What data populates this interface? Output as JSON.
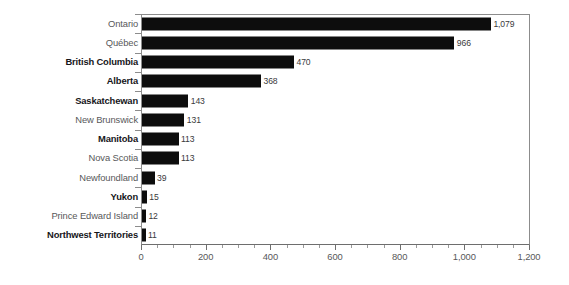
{
  "chart_data": {
    "type": "bar",
    "orientation": "horizontal",
    "title": "",
    "subtitle": "",
    "xlabel": "",
    "ylabel": "",
    "xlim": [
      0,
      1200
    ],
    "grid": false,
    "legend": null,
    "x_ticks": [
      "0",
      "200",
      "400",
      "600",
      "800",
      "1,000",
      "1,200"
    ],
    "x_tick_values": [
      0,
      200,
      400,
      600,
      800,
      1000,
      1200
    ],
    "x_minor_tick_interval": 50,
    "bar_color": "#0d0d0d",
    "frame_color": "#8c8c8c",
    "label_color": "#58585a",
    "label_color_bold": "#16161a",
    "categories": [
      "Ontario",
      "Québec",
      "British Columbia",
      "Alberta",
      "Saskatchewan",
      "New Brunswick",
      "Manitoba",
      "Nova Scotia",
      "Newfoundland",
      "Yukon",
      "Prince Edward Island",
      "Northwest Territories"
    ],
    "values": [
      1079,
      966,
      470,
      368,
      143,
      131,
      113,
      113,
      39,
      15,
      12,
      11
    ],
    "value_labels": [
      "1,079",
      "966",
      "470",
      "368",
      "143",
      "131",
      "113",
      "113",
      "39",
      "15",
      "12",
      "11"
    ],
    "emphasis": [
      false,
      false,
      true,
      true,
      true,
      false,
      true,
      false,
      false,
      true,
      false,
      true
    ],
    "bars": [
      {
        "category": "Ontario",
        "value": 1079,
        "label": "1,079",
        "bold": false
      },
      {
        "category": "Québec",
        "value": 966,
        "label": "966",
        "bold": false
      },
      {
        "category": "British Columbia",
        "value": 470,
        "label": "470",
        "bold": true
      },
      {
        "category": "Alberta",
        "value": 368,
        "label": "368",
        "bold": true
      },
      {
        "category": "Saskatchewan",
        "value": 143,
        "label": "143",
        "bold": true
      },
      {
        "category": "New Brunswick",
        "value": 131,
        "label": "131",
        "bold": false
      },
      {
        "category": "Manitoba",
        "value": 113,
        "label": "113",
        "bold": true
      },
      {
        "category": "Nova Scotia",
        "value": 113,
        "label": "113",
        "bold": false
      },
      {
        "category": "Newfoundland",
        "value": 39,
        "label": "39",
        "bold": false
      },
      {
        "category": "Yukon",
        "value": 15,
        "label": "15",
        "bold": true
      },
      {
        "category": "Prince Edward Island",
        "value": 12,
        "label": "12",
        "bold": false
      },
      {
        "category": "Northwest Territories",
        "value": 11,
        "label": "11",
        "bold": true
      }
    ]
  }
}
